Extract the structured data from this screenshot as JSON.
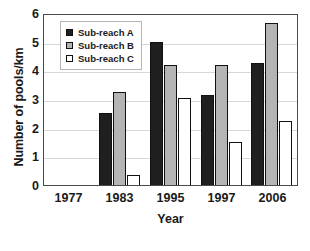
{
  "chart_data": {
    "type": "bar",
    "title": "",
    "subtitle": "",
    "xlabel": "Year",
    "ylabel": "Number of pools/km",
    "categories": [
      "1977",
      "1983",
      "1995",
      "1997",
      "2006"
    ],
    "series": [
      {
        "name": "Sub-reach A",
        "color": "#1f1f1f",
        "values": [
          0,
          2.5,
          5.0,
          3.15,
          4.25
        ]
      },
      {
        "name": "Sub-reach B",
        "color": "#b4b4b4",
        "values": [
          0,
          3.25,
          4.2,
          4.2,
          5.65
        ]
      },
      {
        "name": "Sub-reach C",
        "color": "#ffffff",
        "values": [
          0,
          0.35,
          3.05,
          1.5,
          2.25
        ]
      }
    ],
    "ylim": [
      0,
      6
    ],
    "ytick_labels": [
      "6",
      "5",
      "4",
      "3",
      "2",
      "1",
      "0"
    ],
    "ytick_values": [
      6,
      5,
      4,
      3,
      2,
      1,
      0
    ],
    "grid": "horizontal",
    "legend_position": "top-left-inside",
    "bar_outline_color": "#111111",
    "axis_color": "#4a4a4a",
    "gridline_color": "#d8d8d8"
  },
  "axes": {
    "y_title": "Number of pools/km",
    "x_title": "Year"
  },
  "legend": {
    "items": [
      {
        "label": "Sub-reach A"
      },
      {
        "label": "Sub-reach B"
      },
      {
        "label": "Sub-reach C"
      }
    ]
  },
  "caption": {
    "partial_text": ""
  }
}
